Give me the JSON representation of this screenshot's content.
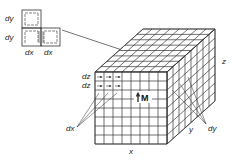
{
  "diagram": {
    "type": "3d-grid-magnetization",
    "colors": {
      "line": "#333333",
      "background": "#ffffff"
    },
    "inset": {
      "labels": {
        "dy_top": "dy",
        "dy_bottom": "dy",
        "dx_left": "dx",
        "dx_right": "dx"
      },
      "cells": 3
    },
    "block": {
      "grid": {
        "cols_x": 8,
        "rows_z": 8,
        "depth_y": 8
      },
      "labels": {
        "x": "x",
        "y": "y",
        "z": "z",
        "dx": "dx",
        "dy": "dy",
        "dz_1": "dz",
        "dz_2": "dz",
        "M": "M"
      }
    }
  }
}
